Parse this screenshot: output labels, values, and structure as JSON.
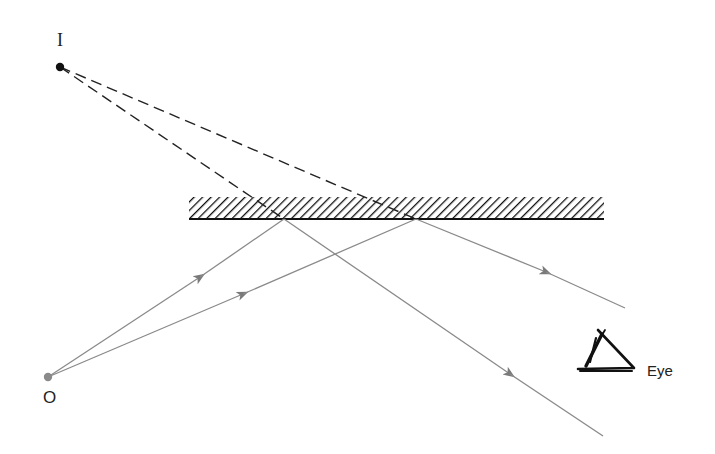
{
  "diagram": {
    "labels": {
      "image_point": "I",
      "object_point": "O",
      "observer": "Eye"
    },
    "points": {
      "image": {
        "x": 60,
        "y": 67
      },
      "object": {
        "x": 48,
        "y": 377
      },
      "reflection_1": {
        "x": 284,
        "y": 219
      },
      "reflection_2": {
        "x": 416,
        "y": 219
      }
    },
    "mirror": {
      "x1": 189,
      "x2": 604,
      "y_top": 197,
      "y_surface": 219
    },
    "rays": {
      "incident": [
        {
          "from": "object",
          "to": "reflection_1"
        },
        {
          "from": "object",
          "to": "reflection_2"
        }
      ],
      "reflected": [
        {
          "from": "reflection_1",
          "end": {
            "x": 603,
            "y": 436
          }
        },
        {
          "from": "reflection_2",
          "end": {
            "x": 625,
            "y": 308
          }
        }
      ],
      "virtual_extensions": [
        {
          "from": "image",
          "to": "reflection_1"
        },
        {
          "from": "image",
          "to": "reflection_2"
        }
      ]
    },
    "colors": {
      "ray": "#8a8a8a",
      "dashed": "#222222",
      "mirror": "#111111",
      "object_point": "#8a8a8a",
      "image_point": "#111111"
    }
  }
}
